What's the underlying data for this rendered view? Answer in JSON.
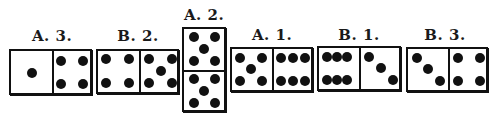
{
  "diagram": {
    "title": "",
    "dominoes": [
      {
        "id": "A3",
        "label": "A. 3.",
        "orientation": "horizontal",
        "halves": [
          1,
          4
        ]
      },
      {
        "id": "B2",
        "label": "B. 2.",
        "orientation": "horizontal",
        "halves": [
          4,
          5
        ]
      },
      {
        "id": "A2",
        "label": "A. 2.",
        "orientation": "vertical",
        "halves": [
          5,
          5
        ]
      },
      {
        "id": "A1",
        "label": "A. 1.",
        "orientation": "horizontal",
        "halves": [
          5,
          6
        ]
      },
      {
        "id": "B1",
        "label": "B. 1.",
        "orientation": "horizontal",
        "halves": [
          6,
          3
        ]
      },
      {
        "id": "B3",
        "label": "B. 3.",
        "orientation": "horizontal",
        "halves": [
          3,
          4
        ]
      }
    ],
    "colors": {
      "ink": "#111111",
      "paper": "#ffffff"
    }
  }
}
